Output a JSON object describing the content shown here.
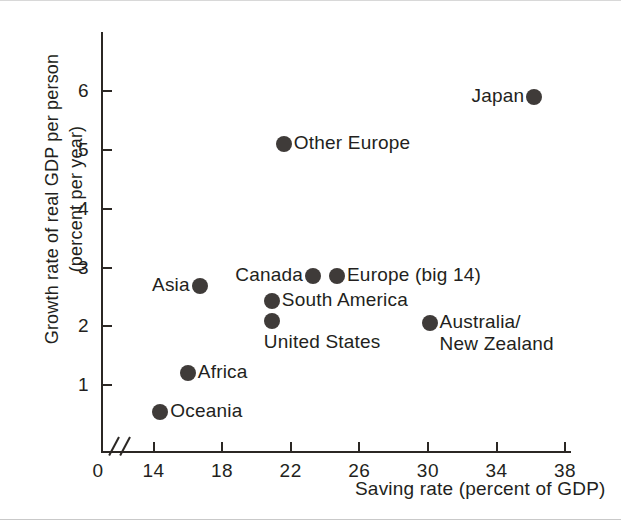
{
  "chart_data": {
    "type": "scatter",
    "title": "",
    "xlabel": "Saving rate (percent of GDP)",
    "ylabel_line1": "Growth rate of real GDP per person",
    "ylabel_line2": "(percent per year)",
    "xlim": [
      12.5,
      39.2
    ],
    "ylim": [
      0,
      6.6
    ],
    "xticks": [
      14,
      18,
      22,
      26,
      30,
      34,
      38
    ],
    "xtick_labels": [
      "14",
      "18",
      "22",
      "26",
      "30",
      "34",
      "38"
    ],
    "yticks": [
      1,
      2,
      3,
      4,
      5,
      6
    ],
    "ytick_labels": [
      "1",
      "2",
      "3",
      "4",
      "5",
      "6"
    ],
    "origin_label": "0",
    "axis_break": "//",
    "grid": false,
    "legend": "none",
    "marker_color": "#3f3b39",
    "axis_color": "#2b2724",
    "points": [
      {
        "label": "Japan",
        "x": 36.2,
        "y": 5.9,
        "label_side": "left"
      },
      {
        "label": "Other Europe",
        "x": 21.6,
        "y": 5.1,
        "label_side": "right"
      },
      {
        "label": "Europe (big 14)",
        "x": 24.7,
        "y": 2.85,
        "label_side": "right"
      },
      {
        "label": "Canada",
        "x": 23.3,
        "y": 2.85,
        "label_side": "left"
      },
      {
        "label": "Asia",
        "x": 16.7,
        "y": 2.68,
        "label_side": "left"
      },
      {
        "label": "South America",
        "x": 20.9,
        "y": 2.43,
        "label_side": "right"
      },
      {
        "label": "United States",
        "x": 20.9,
        "y": 2.1,
        "label_side": "below"
      },
      {
        "label": "Australia/\nNew Zealand",
        "x": 30.1,
        "y": 2.05,
        "label_side": "right"
      },
      {
        "label": "Africa",
        "x": 16.0,
        "y": 1.2,
        "label_side": "right"
      },
      {
        "label": "Oceania",
        "x": 14.4,
        "y": 0.55,
        "label_side": "right"
      }
    ]
  }
}
